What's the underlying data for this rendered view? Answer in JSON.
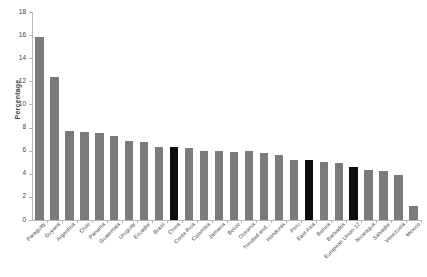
{
  "chart_data": {
    "type": "bar",
    "title": "",
    "xlabel": "",
    "ylabel": "Percentage",
    "ylim": [
      0,
      18
    ],
    "ytick_step": 2,
    "yticks": [
      0,
      2,
      4,
      6,
      8,
      10,
      12,
      14,
      16,
      18
    ],
    "grid": false,
    "legend": "none",
    "orientation": "vertical",
    "bar_colors": {
      "default": "#7b7b7b",
      "highlight": "#0d0d0d"
    },
    "categories": [
      "Paraguay",
      "Guyana",
      "Argentina",
      "Chile",
      "Panama",
      "Guatemala",
      "Uruguay",
      "Ecuador",
      "Brazil",
      "China",
      "Costa Rica",
      "Colombia",
      "Jamaica",
      "Belize",
      "Oceania",
      "Trinidad and...",
      "Honduras",
      "Peru",
      "East Asia",
      "Bolivia",
      "Barbados",
      "European Union-12",
      "Nicaragua",
      "Salvador",
      "Venezuela",
      "Mexico"
    ],
    "values": [
      15.8,
      12.4,
      7.7,
      7.6,
      7.5,
      7.3,
      6.8,
      6.75,
      6.3,
      6.3,
      6.2,
      6.0,
      5.95,
      5.9,
      6.0,
      5.8,
      5.6,
      5.2,
      5.2,
      5.0,
      4.9,
      4.6,
      4.3,
      4.2,
      3.9,
      1.2
    ],
    "highlighted": [
      "China",
      "East Asia",
      "European Union-12"
    ]
  }
}
